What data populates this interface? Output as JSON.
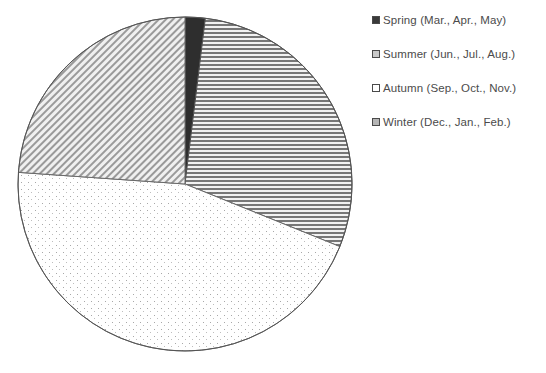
{
  "chart_data": {
    "type": "pie",
    "title": "",
    "categories": [
      "Spring (Mar., Apr., May)",
      "Summer (Jun., Jul., Aug.)",
      "Autumn (Sep., Oct., Nov.)",
      "Winter (Dec., Jan., Feb.)"
    ],
    "values": [
      2,
      29,
      45,
      24
    ],
    "unit": "percent",
    "start_angle_deg": 0,
    "direction": "clockwise",
    "legend_position": "right",
    "grid": false,
    "slices": [
      {
        "label": "Spring (Mar., Apr., May)",
        "short_label": "Spring",
        "months": "Mar., Apr., May",
        "value": 2,
        "start_deg": 0,
        "end_deg": 7,
        "fill_style": "solid-dark",
        "color": "#3a3a3a"
      },
      {
        "label": "Summer (Jun., Jul., Aug.)",
        "short_label": "Summer",
        "months": "Jun., Jul., Aug.",
        "value": 29,
        "start_deg": 7,
        "end_deg": 112,
        "fill_style": "horizontal-lines",
        "color": "#c9c9c9"
      },
      {
        "label": "Autumn (Sep., Oct., Nov.)",
        "short_label": "Autumn",
        "months": "Sep., Oct., Nov.",
        "value": 45,
        "start_deg": 112,
        "end_deg": 274,
        "fill_style": "sparse-dots",
        "color": "#ffffff"
      },
      {
        "label": "Winter (Dec., Jan., Feb.)",
        "short_label": "Winter",
        "months": "Dec., Jan., Feb.",
        "value": 24,
        "start_deg": 274,
        "end_deg": 360,
        "fill_style": "diagonal-hatch",
        "color": "#b5b5b5"
      }
    ],
    "geometry": {
      "center_x": 185,
      "center_y": 184,
      "radius": 167,
      "outline_color": "#555555"
    }
  },
  "legend": {
    "items": [
      {
        "label": "Spring (Mar., Apr., May)",
        "swatch": "swatch-solid-dark"
      },
      {
        "label": "Summer (Jun., Jul., Aug.)",
        "swatch": "swatch-horizontal-lines"
      },
      {
        "label": "Autumn (Sep., Oct., Nov.)",
        "swatch": "swatch-empty"
      },
      {
        "label": "Winter (Dec., Jan., Feb.)",
        "swatch": "swatch-diagonal-hatch"
      }
    ]
  }
}
